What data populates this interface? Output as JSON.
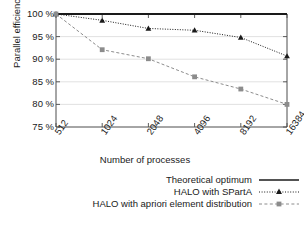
{
  "chart_data": {
    "type": "line",
    "title": "",
    "xlabel": "Number of processes",
    "ylabel": "Parallel efficiency",
    "categories": [
      "512",
      "1024",
      "2048",
      "4096",
      "8192",
      "16384"
    ],
    "x": [
      512,
      1024,
      2048,
      4096,
      8192,
      16384
    ],
    "xscale": "log2",
    "ylim": [
      75,
      100
    ],
    "yticks": [
      "75 %",
      "80 %",
      "85 %",
      "90 %",
      "95 %",
      "100 %"
    ],
    "ytick_values": [
      75,
      80,
      85,
      90,
      95,
      100
    ],
    "grid": "horizontal",
    "legend_position": "below-right",
    "series": [
      {
        "name": "Theoretical optimum",
        "values": [
          100,
          100,
          100,
          100,
          100,
          100
        ],
        "color": "#1a1a1a",
        "style": "solid",
        "marker": "none"
      },
      {
        "name": "HALO with SPartA",
        "values": [
          100,
          98.6,
          96.8,
          96.4,
          94.8,
          90.7
        ],
        "color": "#1a1a1a",
        "style": "dotted",
        "marker": "triangle"
      },
      {
        "name": "HALO with apriori element distribution",
        "values": [
          100,
          92.1,
          90.1,
          86.1,
          83.4,
          80.0
        ],
        "color": "#8c8c8c",
        "style": "dashed",
        "marker": "square"
      }
    ]
  },
  "axes": {
    "y_title": "Parallel efficiency",
    "x_title": "Number of processes"
  },
  "legend": {
    "items": [
      {
        "label": "Theoretical optimum"
      },
      {
        "label": "HALO with SPartA"
      },
      {
        "label": "HALO with apriori element distribution"
      }
    ]
  },
  "colors": {
    "ink": "#1a1a1a",
    "gray_series": "#8c8c8c",
    "grid": "#d9d9d9",
    "frame": "#4d4d4d",
    "background": "#ffffff"
  },
  "caption_sliver": ""
}
